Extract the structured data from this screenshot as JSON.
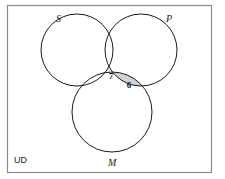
{
  "diagram": {
    "type": "venn-3-set",
    "title": "",
    "universe": {
      "label": "UD",
      "border_color": "#8a8a8a",
      "background": "#ffffff",
      "x": 7,
      "y": 5,
      "width": 204,
      "height": 167
    },
    "stroke_color": "#1a1a1a",
    "stroke_width": 1,
    "shade_color": "#d2d2d2",
    "sets": [
      {
        "id": "S",
        "label": "S",
        "label_x": 56,
        "label_y": 22,
        "cx": 77,
        "cy": 50,
        "r": 36
      },
      {
        "id": "P",
        "label": "P",
        "label_x": 166,
        "label_y": 22,
        "cx": 141,
        "cy": 50,
        "r": 36
      },
      {
        "id": "M",
        "label": "M",
        "label_x": 108,
        "label_y": 166,
        "cx": 112,
        "cy": 112,
        "r": 40
      }
    ],
    "regions": [
      {
        "id": "SPM",
        "name": "s-and-p-and-m",
        "value": "7",
        "shaded": false,
        "x": 111,
        "y": 79
      },
      {
        "id": "PM-not-S",
        "name": "p-and-m-not-s",
        "value": "6",
        "shaded": true,
        "x": 129,
        "y": 88
      }
    ]
  }
}
